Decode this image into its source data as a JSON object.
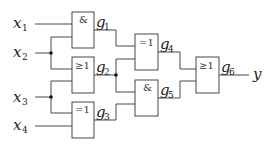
{
  "diagram": {
    "type": "logic-circuit",
    "inputs": [
      {
        "name": "x",
        "sub": "1"
      },
      {
        "name": "x",
        "sub": "2"
      },
      {
        "name": "x",
        "sub": "3"
      },
      {
        "name": "x",
        "sub": "4"
      }
    ],
    "gates": [
      {
        "id": "g1",
        "name": "g",
        "sub": "1",
        "symbol": "&",
        "type": "AND",
        "inputs": [
          "x1",
          "x2"
        ]
      },
      {
        "id": "g2",
        "name": "g",
        "sub": "2",
        "symbol": "≥1",
        "type": "OR",
        "inputs": [
          "x2",
          "x3"
        ]
      },
      {
        "id": "g3",
        "name": "g",
        "sub": "3",
        "symbol": "=1",
        "type": "XOR",
        "inputs": [
          "x3",
          "x4"
        ]
      },
      {
        "id": "g4",
        "name": "g",
        "sub": "4",
        "symbol": "=1",
        "type": "XOR",
        "inputs": [
          "g1",
          "g2"
        ]
      },
      {
        "id": "g5",
        "name": "g",
        "sub": "5",
        "symbol": "&",
        "type": "AND",
        "inputs": [
          "g2",
          "g3"
        ]
      },
      {
        "id": "g6",
        "name": "g",
        "sub": "6",
        "symbol": "≥1",
        "type": "OR",
        "inputs": [
          "g4",
          "g5"
        ]
      }
    ],
    "output": {
      "name": "y",
      "from": "g6"
    }
  }
}
